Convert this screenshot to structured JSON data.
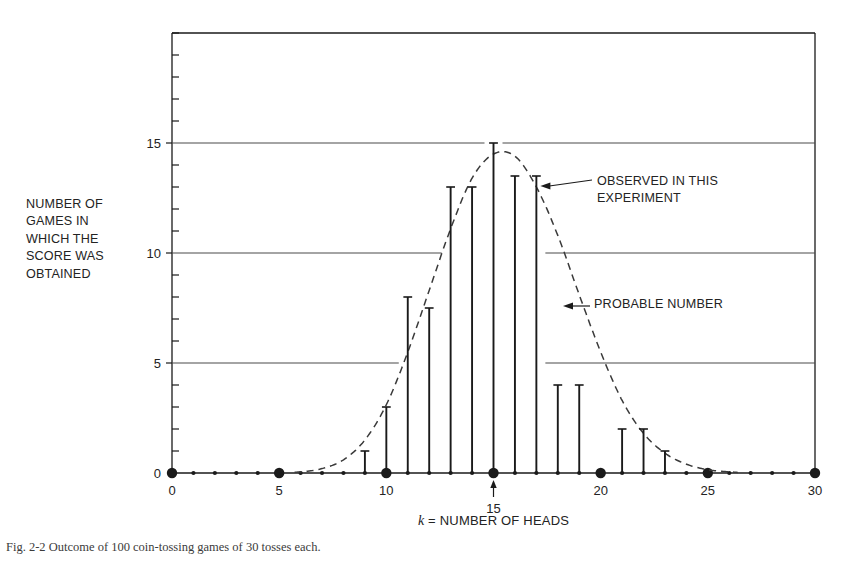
{
  "figure": {
    "y_axis_label": "NUMBER OF\nGAMES IN\nWHICH THE\nSCORE WAS\nOBTAINED",
    "x_axis_label_var": "k",
    "x_axis_label_rest": " = NUMBER OF HEADS",
    "annotation_observed": "OBSERVED IN THIS\nEXPERIMENT",
    "annotation_probable": "PROBABLE NUMBER",
    "caption": "Fig. 2-2  Outcome of 100 coin-tossing games of 30 tosses each.",
    "ink_color": "#1a1a1a",
    "grid_color": "#4a4a4a",
    "curve_color": "#3a3a3a"
  },
  "chart_data": {
    "type": "bar",
    "title": "",
    "subtitle": "",
    "xlabel": "k = NUMBER OF HEADS",
    "ylabel": "NUMBER OF GAMES IN WHICH THE SCORE WAS OBTAINED",
    "xlim": [
      0,
      30
    ],
    "ylim": [
      0,
      20
    ],
    "xticks": [
      0,
      1,
      2,
      3,
      4,
      5,
      6,
      7,
      8,
      9,
      10,
      11,
      12,
      13,
      14,
      15,
      16,
      17,
      18,
      19,
      20,
      21,
      22,
      23,
      24,
      25,
      26,
      27,
      28,
      29,
      30
    ],
    "xtick_labels": [
      "0",
      "5",
      "10",
      "15",
      "20",
      "25",
      "30"
    ],
    "xtick_label_values": [
      0,
      5,
      10,
      15,
      20,
      25,
      30
    ],
    "major_x": [
      0,
      5,
      10,
      15,
      20,
      25,
      30
    ],
    "yticks": [
      0,
      1,
      2,
      3,
      4,
      5,
      6,
      7,
      8,
      9,
      10,
      11,
      12,
      13,
      14,
      15,
      16,
      17,
      18,
      19,
      20
    ],
    "ytick_labels": [
      "0",
      "5",
      "10",
      "15"
    ],
    "ytick_label_values": [
      0,
      5,
      10,
      15
    ],
    "gridlines": [
      5,
      10,
      15
    ],
    "grid": true,
    "legend": "none",
    "categories": [
      0,
      1,
      2,
      3,
      4,
      5,
      6,
      7,
      8,
      9,
      10,
      11,
      12,
      13,
      14,
      15,
      16,
      17,
      18,
      19,
      20,
      21,
      22,
      23,
      24,
      25,
      26,
      27,
      28,
      29,
      30
    ],
    "series": [
      {
        "name": "OBSERVED IN THIS EXPERIMENT",
        "style": "stem",
        "values": [
          0,
          0,
          0,
          0,
          0,
          0,
          0,
          0,
          0,
          1,
          3,
          8,
          7.5,
          13,
          13,
          15,
          13.5,
          13.5,
          4,
          4,
          0,
          2,
          2,
          1,
          0,
          0,
          0,
          0,
          0,
          0,
          0
        ]
      },
      {
        "name": "PROBABLE NUMBER",
        "style": "dashed-curve",
        "values": [
          0,
          0,
          0,
          0,
          0,
          0.01,
          0.05,
          0.2,
          0.6,
          1.5,
          3.1,
          5.5,
          8.3,
          11.1,
          13.4,
          14.5,
          14.4,
          13.0,
          10.8,
          8.1,
          5.5,
          3.3,
          1.8,
          0.9,
          0.4,
          0.15,
          0.05,
          0.01,
          0,
          0,
          0
        ]
      }
    ],
    "annotations": [
      {
        "text": "OBSERVED IN THIS EXPERIMENT",
        "points_to_k": 17
      },
      {
        "text": "PROBABLE NUMBER",
        "points_to_k": 19
      },
      {
        "text": "15",
        "points_to_k": 15,
        "position": "below-axis"
      }
    ]
  }
}
